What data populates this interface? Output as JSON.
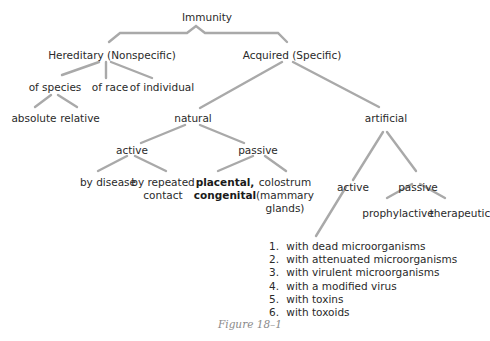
{
  "diagram": {
    "root": "Immunity",
    "hereditary": {
      "label": "Hereditary (Nonspecific)",
      "children": [
        "of species",
        "of race",
        "of individual"
      ],
      "species_children": [
        "absolute",
        "relative"
      ]
    },
    "acquired": {
      "label": "Acquired (Specific)",
      "natural": {
        "label": "natural",
        "active": {
          "label": "active",
          "children": [
            "by disease",
            "by repeated\ncontact"
          ]
        },
        "passive": {
          "label": "passive",
          "children": [
            "placental,\ncongenital",
            "colostrum\n(mammary\nglands)"
          ]
        }
      },
      "artificial": {
        "label": "artificial",
        "active": {
          "label": "active",
          "methods": [
            {
              "num": "1.",
              "text": "with dead microorganisms"
            },
            {
              "num": "2.",
              "text": "with attenuated microorganisms"
            },
            {
              "num": "3.",
              "text": "with virulent microorganisms"
            },
            {
              "num": "4.",
              "text": "with a modified virus"
            },
            {
              "num": "5.",
              "text": "with toxins"
            },
            {
              "num": "6.",
              "text": "with toxoids"
            }
          ]
        },
        "passive": {
          "label": "passive",
          "children": [
            "prophylactive",
            "therapeutic"
          ]
        }
      }
    },
    "caption": "Figure 18–1"
  }
}
